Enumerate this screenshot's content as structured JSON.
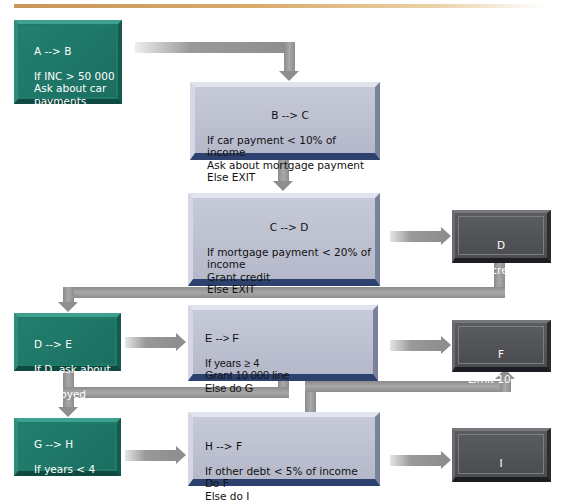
{
  "diagram": {
    "type": "flowchart",
    "colors": {
      "teal_box": "#1f7a6a",
      "silver_box": "#babecd",
      "dark_box": "#505256",
      "connector": "#999999",
      "top_rule": "#d9a96a"
    },
    "nodes": {
      "a_b": {
        "title": "A --> B",
        "lines": "If INC > 50 000\nAsk about car\npayments\nElse EXIT"
      },
      "b_c": {
        "title": "B --> C",
        "lines": "If car payment < 10% of income\nAsk about mortgage payment\nElse EXIT"
      },
      "c_d": {
        "title": "C --> D",
        "lines": "If mortgage payment < 20% of\nincome\nGrant credit\nElse EXIT"
      },
      "d": {
        "title": "D",
        "lines": "Grant credit line"
      },
      "d_e": {
        "title": "D --> E",
        "lines": "If D, ask about\nyears employed"
      },
      "e_f": {
        "title": "E --> F",
        "lines": "If years ≥ 4\nGrant 10 000 line\nElse do G"
      },
      "f": {
        "title": "F",
        "lines": "Limit 10 000"
      },
      "g_h": {
        "title": "G --> H",
        "lines": "If years < 4\nAsk about\nother debt"
      },
      "h_f": {
        "title": "H --> F",
        "lines": "If other debt < 5% of income\nDo F\nElse do I"
      },
      "i": {
        "title": "I",
        "lines": "Limit 3000"
      }
    },
    "edges": [
      [
        "A --> B",
        "B --> C"
      ],
      [
        "B --> C",
        "C --> D"
      ],
      [
        "C --> D",
        "D"
      ],
      [
        "D",
        "D --> E"
      ],
      [
        "D --> E",
        "E --> F"
      ],
      [
        "D --> E",
        "G --> H"
      ],
      [
        "E --> F",
        "F"
      ],
      [
        "E --> F",
        "G --> H"
      ],
      [
        "G --> H",
        "H --> F"
      ],
      [
        "H --> F",
        "F"
      ],
      [
        "H --> F",
        "I"
      ]
    ]
  }
}
